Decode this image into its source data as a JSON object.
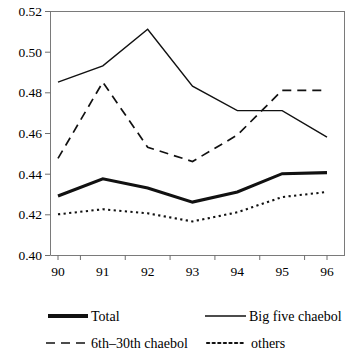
{
  "chart_data": {
    "type": "line",
    "title": "",
    "subtitle": "",
    "xlabel": "",
    "ylabel": "",
    "x": [
      "90",
      "91",
      "92",
      "93",
      "94",
      "95",
      "96"
    ],
    "categories": [
      "90",
      "91",
      "92",
      "93",
      "94",
      "95",
      "96"
    ],
    "xlim": [
      "90",
      "96"
    ],
    "ylim": [
      0.4,
      0.52
    ],
    "ytick_labels": [
      "0.52",
      "0.50",
      "0.48",
      "0.46",
      "0.44",
      "0.42",
      "0.40"
    ],
    "ytick_values": [
      0.52,
      0.5,
      0.48,
      0.46,
      0.44,
      0.42,
      0.4
    ],
    "ytick_step": 0.02,
    "grid": false,
    "legend_position": "bottom",
    "series": [
      {
        "name": "Total",
        "style": "thick-solid",
        "values": [
          0.429,
          0.4375,
          0.433,
          0.426,
          0.431,
          0.44,
          0.4405
        ]
      },
      {
        "name": "Big five chaebol",
        "style": "solid",
        "values": [
          0.485,
          0.493,
          0.511,
          0.483,
          0.471,
          0.471,
          0.458
        ]
      },
      {
        "name": "6th–30th chaebol",
        "style": "dashed",
        "values": [
          0.4475,
          0.485,
          0.453,
          0.446,
          0.459,
          0.481,
          0.481
        ]
      },
      {
        "name": "others",
        "style": "dotted",
        "values": [
          0.42,
          0.4225,
          0.4205,
          0.4165,
          0.421,
          0.4285,
          0.431
        ]
      }
    ]
  },
  "legend": {
    "entries": [
      {
        "label": "Total",
        "swatch": "thick-solid-swatch"
      },
      {
        "label": "Big five chaebol",
        "swatch": "solid-swatch"
      },
      {
        "label": "6th–30th chaebol",
        "swatch": "dashed-swatch"
      },
      {
        "label": "others",
        "swatch": "dotted-swatch"
      }
    ]
  },
  "colors": {
    "series": "#111111",
    "axis": "#7a7a7a",
    "background": "#ffffff"
  }
}
